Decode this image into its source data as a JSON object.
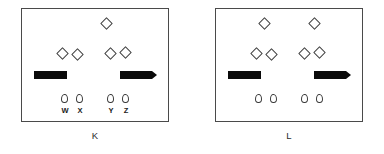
{
  "figure": {
    "title": "",
    "background_color": "#ffffff",
    "outline_color": "#4a4a4a",
    "fill_color": "#0a0a0a"
  },
  "panels": [
    {
      "id": "K",
      "caption": "K",
      "diamonds_top": 1,
      "diamonds_middle": 4,
      "bars": 2,
      "drops": 4,
      "drop_labels": [
        "W",
        "X",
        "Y",
        "Z"
      ]
    },
    {
      "id": "L",
      "caption": "L",
      "diamonds_top": 2,
      "diamonds_middle": 4,
      "bars": 2,
      "drops": 4,
      "drop_labels": [
        "",
        "",
        "",
        ""
      ]
    }
  ],
  "labels": {
    "w": "W",
    "x": "X",
    "y": "Y",
    "z": "Z",
    "panel_k": "K",
    "panel_l": "L"
  }
}
